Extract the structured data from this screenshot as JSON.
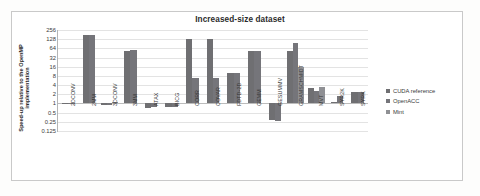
{
  "chart_data": {
    "type": "bar",
    "title": "Increased-size dataset",
    "xlabel": "",
    "ylabel": "Speed-up relative to the OpenMP implementation",
    "yscale": "log2",
    "ylim": [
      0.125,
      256
    ],
    "yticks": [
      256,
      128,
      64,
      32,
      16,
      8,
      4,
      2,
      1,
      0.5,
      0.25,
      0.125
    ],
    "ytick_labels": [
      "256",
      "128",
      "64",
      "32",
      "16",
      "8",
      "4",
      "2",
      "1",
      "0.5",
      "0.25",
      "0.125"
    ],
    "grid": true,
    "legend_position": "right",
    "categories": [
      "2DCONV",
      "2MM",
      "3DCONV",
      "3MM",
      "ATAX",
      "BICG",
      "CORR",
      "COVAR",
      "FDTD-2D",
      "GEMM",
      "GESUMMV",
      "GRAMSCHMIDT",
      "MVT",
      "SYR2K",
      "SYRK"
    ],
    "series": [
      {
        "name": "CUDA reference",
        "color": "#6f6f72",
        "values": [
          1.02,
          181,
          0.86,
          52,
          0.72,
          0.74,
          132,
          133,
          9.6,
          51,
          0.28,
          51,
          3.3,
          1.12,
          2.3
        ]
      },
      {
        "name": "OpenACC",
        "color": "#75757a",
        "values": [
          1.0,
          181,
          0.88,
          56,
          0.74,
          0.76,
          6.9,
          6.7,
          10.0,
          52,
          0.27,
          96,
          2.6,
          1.75,
          2.35
        ]
      },
      {
        "name": "Mint",
        "color": "#8f9094",
        "values": [
          null,
          null,
          1.12,
          null,
          null,
          null,
          null,
          null,
          null,
          null,
          null,
          15.5,
          3.4,
          null,
          null
        ]
      }
    ]
  },
  "legend": {
    "items": [
      {
        "label": "CUDA reference",
        "color": "#6f6f72"
      },
      {
        "label": "OpenACC",
        "color": "#75757a"
      },
      {
        "label": "Mint",
        "color": "#8f9094"
      }
    ]
  }
}
